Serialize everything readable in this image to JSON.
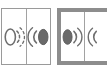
{
  "screen": {
    "width": 107,
    "height": 73,
    "background": "#ffffff",
    "description": "Two adjacent icon button panels with audio speaker glyphs; right panel is selected"
  },
  "colors": {
    "background": "#ffffff",
    "panel_fill": "#ffffff",
    "border_normal": "#9a9a9a",
    "border_selected": "#8d8d8d",
    "divider": "#a2a2a2",
    "glyph_stroke": "#6e6e6e",
    "glyph_fill_dark": "#6a6a6a",
    "glyph_fill_none": "none"
  },
  "panels": [
    {
      "id": "panel-left",
      "name": "audio-panel-unselected",
      "selected": false,
      "border_color": "#9a9a9a",
      "border_width": 1,
      "buttons": [
        {
          "id": "mute-button",
          "icon": "speaker-muted-icon",
          "label": "Mute",
          "state": "off",
          "description": "outlined oval speaker body with dashed sound arcs on the right",
          "oval_filled": false,
          "waves_side": "right",
          "waves_count": 2,
          "waves_dashed": true
        },
        {
          "id": "volume-left-button",
          "icon": "speaker-waves-left-icon",
          "label": "Volume",
          "state": "on",
          "description": "filled dark oval with solid sound arcs on the left",
          "oval_filled": true,
          "waves_side": "left",
          "waves_count": 2,
          "waves_dashed": false
        }
      ]
    },
    {
      "id": "panel-right",
      "name": "audio-panel-selected",
      "selected": true,
      "border_color": "#8d8d8d",
      "border_width": 4,
      "buttons": [
        {
          "id": "volume-right-button",
          "icon": "speaker-waves-right-icon",
          "label": "Volume",
          "state": "on",
          "description": "filled dark oval with solid sound arcs on the right",
          "oval_filled": true,
          "waves_side": "right",
          "waves_count": 2,
          "waves_dashed": false
        },
        {
          "id": "volume-partial-button",
          "icon": "speaker-waves-partial-icon",
          "label": "Volume",
          "state": "on",
          "description": "partially clipped sound arc at panel edge",
          "oval_filled": false,
          "waves_side": "left",
          "waves_count": 1,
          "waves_dashed": false
        }
      ]
    }
  ]
}
